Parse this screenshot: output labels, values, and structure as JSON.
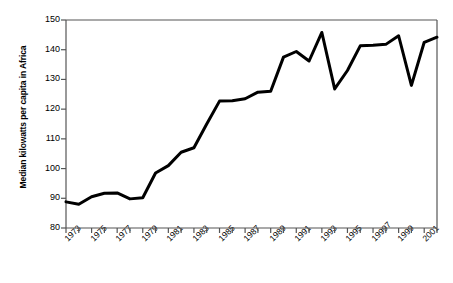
{
  "chart_data": {
    "type": "line",
    "title": "",
    "subtitle": "",
    "xlabel": "",
    "ylabel": "Median kilowatts per capita in Africa",
    "ylim": [
      80,
      150
    ],
    "xlim": [
      1973,
      2002
    ],
    "y_ticks": [
      80,
      90,
      100,
      110,
      120,
      130,
      140,
      150
    ],
    "y_tick_labels": [
      "80",
      "90",
      "100",
      "110",
      "120",
      "130",
      "140",
      "150"
    ],
    "x_tick_labels": [
      "1973",
      "1975",
      "1977",
      "1979",
      "1981",
      "1983",
      "1985",
      "1987",
      "1989",
      "1991",
      "1993",
      "1995",
      "19997",
      "1999",
      "2001"
    ],
    "x_tick_label_years": [
      1973,
      1975,
      1977,
      1979,
      1981,
      1983,
      1985,
      1987,
      1989,
      1991,
      1993,
      1995,
      1997,
      1999,
      2001
    ],
    "grid": false,
    "legend": false,
    "legend_position": "none",
    "line_color": "#000000",
    "line_width": 3,
    "axis_color": "#555555",
    "background_color": "#ffffff",
    "x": [
      1973,
      1974,
      1975,
      1976,
      1977,
      1978,
      1979,
      1980,
      1981,
      1982,
      1983,
      1984,
      1985,
      1986,
      1987,
      1988,
      1989,
      1990,
      1991,
      1992,
      1993,
      1994,
      1995,
      1996,
      1997,
      1998,
      1999,
      2000,
      2001,
      2002
    ],
    "values": [
      88.8,
      88.0,
      90.5,
      91.7,
      91.8,
      89.8,
      90.2,
      98.5,
      101.0,
      105.5,
      107.0,
      115.0,
      122.7,
      122.8,
      123.5,
      125.7,
      126.0,
      137.5,
      139.4,
      136.2,
      145.8,
      126.8,
      133.0,
      141.3,
      141.5,
      141.8,
      144.7,
      128.0,
      142.5,
      144.2
    ],
    "series": [
      {
        "name": "Median kilowatts per capita in Africa",
        "values": [
          88.8,
          88.0,
          90.5,
          91.7,
          91.8,
          89.8,
          90.2,
          98.5,
          101.0,
          105.5,
          107.0,
          115.0,
          122.7,
          122.8,
          123.5,
          125.7,
          126.0,
          137.5,
          139.4,
          136.2,
          145.8,
          126.8,
          133.0,
          141.3,
          141.5,
          141.8,
          144.7,
          128.0,
          142.5,
          144.2
        ]
      }
    ]
  },
  "plot_geometry": {
    "left": 66,
    "right": 437,
    "top": 20,
    "bottom": 228
  }
}
